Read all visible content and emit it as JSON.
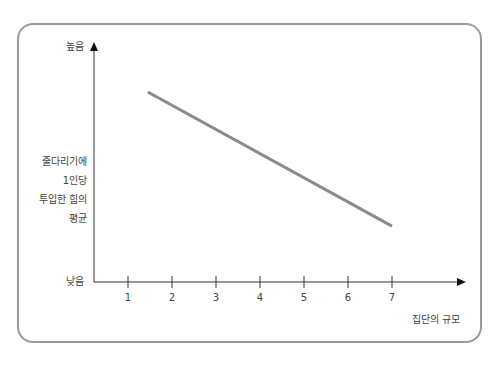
{
  "chart_data": {
    "type": "line",
    "title": "",
    "xlabel": "집단의 규모",
    "ylabel": [
      "줄다리기에",
      "1인당",
      "투입한 힘의",
      "평균"
    ],
    "y_high_label": "높음",
    "y_low_label": "낮음",
    "categories": [
      "1",
      "2",
      "3",
      "4",
      "5",
      "6",
      "7"
    ],
    "xlim": [
      1,
      7
    ],
    "ylim": [
      0,
      100
    ],
    "series": [
      {
        "name": "1인당 투입한 힘의 평균",
        "x": [
          1.45,
          7
        ],
        "values": [
          79.5,
          23.4
        ]
      }
    ],
    "grid": false,
    "legend": null,
    "line_color": "#8a8a8a",
    "axis_color": "#333333",
    "frame_color": "#9a9a9a"
  },
  "labels": {
    "high": "높음",
    "low": "낮음",
    "x_title": "집단의 규모",
    "y_lines": [
      "줄다리기에",
      "1인당",
      "투입한 힘의",
      "평균"
    ],
    "ticks": [
      "1",
      "2",
      "3",
      "4",
      "5",
      "6",
      "7"
    ]
  }
}
